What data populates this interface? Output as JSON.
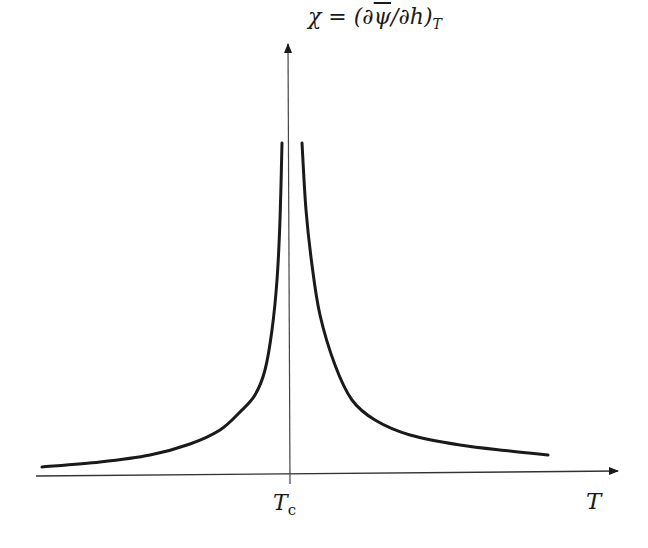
{
  "chart_data": {
    "type": "line",
    "title": "",
    "xlabel": "T",
    "ylabel": "χ = (∂ψ̄/∂h)_T",
    "ylabel_parts": {
      "lhs": "χ = (∂",
      "overlined": "ψ",
      "mid": "/∂h)",
      "subscript": "T"
    },
    "x_ticks": [
      {
        "label": "T",
        "subscript": "c",
        "position": "critical temperature"
      }
    ],
    "grid": false,
    "legend": null,
    "series": [
      {
        "name": "left branch (T < Tc)",
        "points_px": [
          [
            42,
            467
          ],
          [
            100,
            462
          ],
          [
            150,
            455
          ],
          [
            190,
            444
          ],
          [
            220,
            430
          ],
          [
            240,
            412
          ],
          [
            255,
            395
          ],
          [
            265,
            370
          ],
          [
            272,
            330
          ],
          [
            277,
            280
          ],
          [
            280,
            220
          ],
          [
            282,
            143
          ]
        ]
      },
      {
        "name": "right branch (T > Tc)",
        "points_px": [
          [
            302,
            143
          ],
          [
            306,
            210
          ],
          [
            312,
            265
          ],
          [
            320,
            315
          ],
          [
            335,
            365
          ],
          [
            352,
            400
          ],
          [
            375,
            420
          ],
          [
            410,
            435
          ],
          [
            460,
            445
          ],
          [
            510,
            451
          ],
          [
            548,
            455
          ]
        ]
      }
    ]
  },
  "labels": {
    "y_lhs": "χ = (∂",
    "y_psi": "ψ",
    "y_mid": "/∂h)",
    "y_sub": "T",
    "tc_main": "T",
    "tc_sub": "c",
    "x_axis": "T"
  }
}
